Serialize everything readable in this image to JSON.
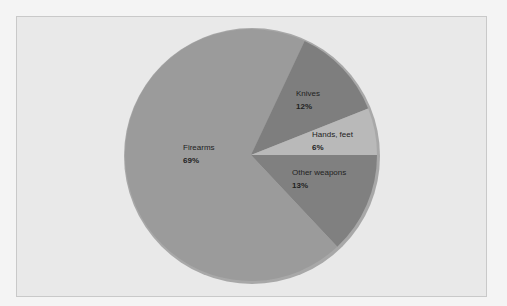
{
  "chart_data": {
    "type": "pie",
    "title": "",
    "slices": [
      {
        "label": "Firearms",
        "value": 69,
        "display": "69%",
        "color": "#9b9b9b"
      },
      {
        "label": "Knives",
        "value": 12,
        "display": "12%",
        "color": "#7e7e7e"
      },
      {
        "label": "Hands, feet",
        "value": 6,
        "display": "6%",
        "color": "#b9b9b9"
      },
      {
        "label": "Other weapons",
        "value": 13,
        "display": "13%",
        "color": "#808080"
      }
    ],
    "legend": "none (labels placed inside slices)",
    "units": "percent"
  },
  "labels": {
    "firearms": {
      "name": "Firearms",
      "pct": "69%"
    },
    "knives": {
      "name": "Knives",
      "pct": "12%"
    },
    "hands_feet": {
      "name": "Hands, feet",
      "pct": "6%"
    },
    "other_weapons": {
      "name": "Other weapons",
      "pct": "13%"
    }
  }
}
